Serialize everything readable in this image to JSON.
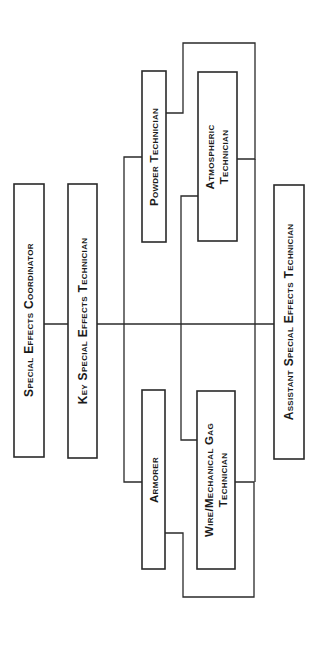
{
  "diagram": {
    "orientation": "rotated-90-ccw",
    "colors": {
      "line": "#2a2a2a",
      "text": "#1a1a1a",
      "background": "#ffffff"
    },
    "nodes": {
      "coordinator": {
        "lines": [
          "Special Effects Coordinator"
        ]
      },
      "key": {
        "lines": [
          "Key Special Effects Technician"
        ]
      },
      "powder": {
        "lines": [
          "Powder Technician"
        ]
      },
      "atmospheric": {
        "lines": [
          "Atmospheric",
          "Technician"
        ]
      },
      "armorer": {
        "lines": [
          "Armorer"
        ]
      },
      "wire": {
        "lines": [
          "Wire/Mechanical Gag",
          "Technician"
        ]
      },
      "assistant": {
        "lines": [
          "Assistant Special Effects Technician"
        ]
      }
    },
    "edges": [
      [
        "coordinator",
        "key"
      ],
      [
        "key",
        "powder"
      ],
      [
        "key",
        "atmospheric"
      ],
      [
        "key",
        "armorer"
      ],
      [
        "key",
        "wire"
      ],
      [
        "key",
        "assistant"
      ],
      [
        "powder",
        "atmospheric"
      ],
      [
        "armorer",
        "wire"
      ]
    ]
  }
}
